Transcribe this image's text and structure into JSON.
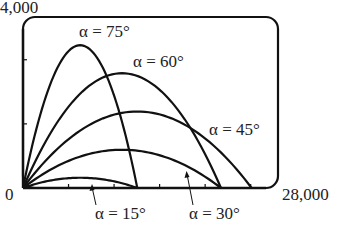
{
  "chart_data": {
    "type": "line",
    "title": "",
    "xlabel": "",
    "ylabel": "",
    "xlim": [
      0,
      28000
    ],
    "ylim": [
      0,
      4000
    ],
    "grid": false,
    "legend": "none (inline curve labels)",
    "x_tick_labels": [
      "0",
      "28,000"
    ],
    "y_tick_labels": [
      "4,000"
    ],
    "x_minor_ticks": [
      5000,
      10000,
      15000,
      20000,
      25000
    ],
    "y_minor_ticks": [
      1500,
      3000
    ],
    "series": [
      {
        "name": "α = 15°",
        "angle_deg": 15,
        "range": 12550,
        "max_height": 240
      },
      {
        "name": "α = 30°",
        "angle_deg": 30,
        "range": 21740,
        "max_height": 895
      },
      {
        "name": "α = 45°",
        "angle_deg": 45,
        "range": 25100,
        "max_height": 1790
      },
      {
        "name": "α = 60°",
        "angle_deg": 60,
        "range": 21740,
        "max_height": 2685
      },
      {
        "name": "α = 75°",
        "angle_deg": 75,
        "range": 12550,
        "max_height": 3340
      }
    ],
    "annotations": [
      "α = 75°",
      "α = 60°",
      "α = 45°",
      "α = 15°",
      "α = 30°"
    ]
  },
  "axis": {
    "origin_label": "0",
    "x_max_label": "28,000",
    "y_max_label": "4,000"
  },
  "labels": {
    "a75": "α = 75°",
    "a60": "α = 60°",
    "a45": "α = 45°",
    "a15": "α = 15°",
    "a30": "α = 30°"
  }
}
